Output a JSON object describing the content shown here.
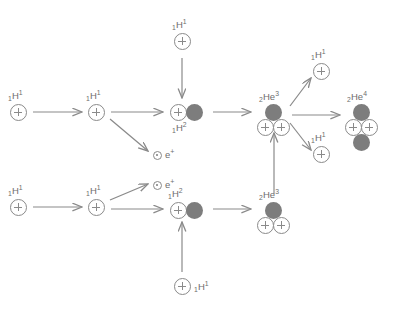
{
  "diagram": {
    "colors": {
      "stroke": "#8a8a8a",
      "neutron_fill": "#7d7d7d",
      "text": "#6e6e6e",
      "background": "#ffffff"
    },
    "particle_glyphs": {
      "proton": "+",
      "neutron": "filled-circle",
      "positron": "dot-circle"
    },
    "labels": {
      "hydrogen_1": {
        "sub": "1",
        "element": "H",
        "sup": "1"
      },
      "hydrogen_2": {
        "sub": "1",
        "element": "H",
        "sup": "2"
      },
      "helium_3": {
        "sub": "2",
        "element": "He",
        "sup": "3"
      },
      "helium_4": {
        "sub": "2",
        "element": "He",
        "sup": "4"
      },
      "positron": {
        "element": "e",
        "sup": "+"
      }
    },
    "nodes": [
      {
        "id": "h1-a",
        "name": "hydrogen-1-top-input",
        "kind": "H1",
        "x": 10,
        "y": 104,
        "label_pos": "above"
      },
      {
        "id": "h1-b",
        "name": "hydrogen-1-upper-row-second",
        "kind": "H1",
        "x": 88,
        "y": 104,
        "label_pos": "above"
      },
      {
        "id": "h1-c",
        "name": "hydrogen-1-top-feed",
        "kind": "H1",
        "x": 174,
        "y": 33,
        "label_pos": "above"
      },
      {
        "id": "h2-a",
        "name": "deuterium-upper",
        "kind": "H2",
        "x": 170,
        "y": 104,
        "label_pos": "below"
      },
      {
        "id": "e-a",
        "name": "positron-upper",
        "kind": "E",
        "x": 153,
        "y": 151,
        "label_pos": "right"
      },
      {
        "id": "he3-a",
        "name": "helium-3-upper",
        "kind": "HE3",
        "x": 257,
        "y": 104,
        "label_pos": "above"
      },
      {
        "id": "h1-d",
        "name": "hydrogen-1-bottom-input",
        "kind": "H1",
        "x": 10,
        "y": 199,
        "label_pos": "above"
      },
      {
        "id": "h1-e",
        "name": "hydrogen-1-lower-row-second",
        "kind": "H1",
        "x": 88,
        "y": 199,
        "label_pos": "above"
      },
      {
        "id": "e-b",
        "name": "positron-lower",
        "kind": "E",
        "x": 153,
        "y": 181,
        "label_pos": "right"
      },
      {
        "id": "h2-b",
        "name": "deuterium-lower",
        "kind": "H2",
        "x": 170,
        "y": 202,
        "label_pos": "above"
      },
      {
        "id": "h1-f",
        "name": "hydrogen-1-bottom-feed",
        "kind": "H1",
        "x": 174,
        "y": 278,
        "label_pos": "right"
      },
      {
        "id": "he3-b",
        "name": "helium-3-lower",
        "kind": "HE3",
        "x": 257,
        "y": 202,
        "label_pos": "above"
      },
      {
        "id": "h1-g",
        "name": "hydrogen-1-output-upper",
        "kind": "H1",
        "x": 313,
        "y": 63,
        "label_pos": "above"
      },
      {
        "id": "h1-h",
        "name": "hydrogen-1-output-lower",
        "kind": "H1",
        "x": 313,
        "y": 146,
        "label_pos": "above"
      },
      {
        "id": "he4",
        "name": "helium-4-output",
        "kind": "HE4",
        "x": 345,
        "y": 104,
        "label_pos": "above"
      }
    ],
    "arrows": [
      {
        "name": "arrow-h1a-to-h1b",
        "x1": 33,
        "y1": 112,
        "x2": 82,
        "y2": 112
      },
      {
        "name": "arrow-h1b-to-h2a",
        "x1": 111,
        "y1": 112,
        "x2": 163,
        "y2": 112
      },
      {
        "name": "arrow-h1b-to-ea",
        "x1": 110,
        "y1": 119,
        "x2": 148,
        "y2": 151
      },
      {
        "name": "arrow-h1c-to-h2a",
        "x1": 182,
        "y1": 58,
        "x2": 182,
        "y2": 98
      },
      {
        "name": "arrow-h2a-to-he3a",
        "x1": 213,
        "y1": 112,
        "x2": 251,
        "y2": 112
      },
      {
        "name": "arrow-h1d-to-h1e",
        "x1": 33,
        "y1": 207,
        "x2": 82,
        "y2": 207
      },
      {
        "name": "arrow-h1e-to-h2b",
        "x1": 111,
        "y1": 209,
        "x2": 163,
        "y2": 209
      },
      {
        "name": "arrow-h1e-to-eb",
        "x1": 110,
        "y1": 200,
        "x2": 148,
        "y2": 184
      },
      {
        "name": "arrow-h1f-to-h2b",
        "x1": 182,
        "y1": 272,
        "x2": 182,
        "y2": 222
      },
      {
        "name": "arrow-h2b-to-he3b",
        "x1": 213,
        "y1": 209,
        "x2": 251,
        "y2": 209
      },
      {
        "name": "arrow-he3b-to-he3a",
        "x1": 274,
        "y1": 194,
        "x2": 274,
        "y2": 133
      },
      {
        "name": "arrow-he3a-to-h1g",
        "x1": 290,
        "y1": 106,
        "x2": 311,
        "y2": 78
      },
      {
        "name": "arrow-he3a-to-he4",
        "x1": 292,
        "y1": 115,
        "x2": 340,
        "y2": 115
      },
      {
        "name": "arrow-he3a-to-h1h",
        "x1": 290,
        "y1": 123,
        "x2": 311,
        "y2": 150
      }
    ]
  }
}
